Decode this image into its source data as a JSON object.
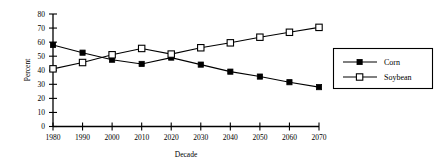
{
  "chart_data": {
    "type": "line",
    "title": "",
    "xlabel": "Decade",
    "ylabel": "Percent",
    "categories": [
      "1980",
      "1990",
      "2000",
      "2010",
      "2020",
      "2030",
      "2040",
      "2050",
      "2060",
      "2070"
    ],
    "series": [
      {
        "name": "Corn",
        "marker": "filled-square",
        "color": "#000000",
        "values": [
          58,
          52.5,
          47.5,
          44.5,
          49,
          44,
          39,
          35.5,
          31.5,
          28
        ]
      },
      {
        "name": "Soybean",
        "marker": "hollow-square",
        "color": "#000000",
        "values": [
          41,
          45.5,
          51,
          55.5,
          51.5,
          56,
          59.5,
          63.5,
          67,
          70.5
        ]
      }
    ],
    "ylim": [
      0,
      80
    ],
    "y_ticks": [
      "0",
      "10",
      "20",
      "30",
      "40",
      "50",
      "60",
      "70",
      "80"
    ],
    "x_ticks": [
      "1980",
      "1990",
      "2000",
      "2010",
      "2020",
      "2030",
      "2040",
      "2050",
      "2060",
      "2070"
    ],
    "grid": false,
    "legend_position": "right"
  },
  "axes": {
    "y_title": "Percent",
    "x_title": "Decade",
    "y_tick_labels": [
      "80",
      "70",
      "60",
      "50",
      "40",
      "30",
      "20",
      "10",
      "0"
    ],
    "x_tick_labels": [
      "1980",
      "1990",
      "2000",
      "2010",
      "2020",
      "2030",
      "2040",
      "2050",
      "2060",
      "2070"
    ]
  },
  "legend": {
    "entries": [
      {
        "label": "Corn",
        "marker": "filled-square"
      },
      {
        "label": "Soybean",
        "marker": "hollow-square"
      }
    ]
  }
}
